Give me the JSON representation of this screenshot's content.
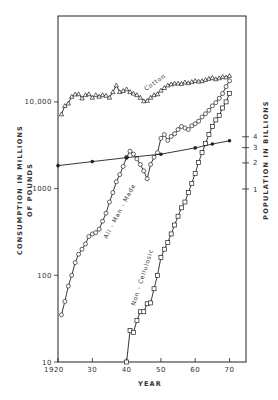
{
  "chart_data": {
    "type": "line",
    "title": "",
    "xlabel": "YEAR",
    "ylabel": "CONSUMPTION IN MILLIONS OF POUNDS",
    "ylabel_line1": "CONSUMPTION  IN  MILLIONS",
    "ylabel_line2": "OF  POUNDS",
    "y2label": "POPULATION  IN  BILLIONS",
    "yscale": "log",
    "xlim": [
      1920,
      1975
    ],
    "ylim": [
      10,
      100000
    ],
    "y2lim_ticks": [
      1,
      2,
      3,
      4
    ],
    "grid": false,
    "legend": "inline labels",
    "x_ticks": [
      {
        "value": 1920,
        "label": "1920"
      },
      {
        "value": 1930,
        "label": "30"
      },
      {
        "value": 1940,
        "label": "40"
      },
      {
        "value": 1950,
        "label": "50"
      },
      {
        "value": 1960,
        "label": "60"
      },
      {
        "value": 1970,
        "label": "70"
      }
    ],
    "y_ticks": [
      {
        "value": 10,
        "label": "10"
      },
      {
        "value": 100,
        "label": "100"
      },
      {
        "value": 1000,
        "label": "1000"
      },
      {
        "value": 10000,
        "label": "10,000"
      }
    ],
    "y2_ticks": [
      {
        "value": 1,
        "label": "1"
      },
      {
        "value": 2,
        "label": "2"
      },
      {
        "value": 3,
        "label": "3"
      },
      {
        "value": 4,
        "label": "4"
      }
    ],
    "series": [
      {
        "name": "Cotton",
        "marker": "triangle",
        "x": [
          1921,
          1922,
          1923,
          1924,
          1925,
          1926,
          1927,
          1928,
          1929,
          1930,
          1931,
          1932,
          1933,
          1934,
          1935,
          1936,
          1937,
          1938,
          1939,
          1940,
          1941,
          1942,
          1943,
          1944,
          1945,
          1946,
          1947,
          1948,
          1949,
          1950,
          1951,
          1952,
          1953,
          1954,
          1955,
          1956,
          1957,
          1958,
          1959,
          1960,
          1961,
          1962,
          1963,
          1964,
          1965,
          1966,
          1967,
          1968,
          1969,
          1970
        ],
        "values": [
          7200,
          9000,
          9600,
          11500,
          12200,
          12300,
          11000,
          12000,
          12300,
          11200,
          12000,
          11500,
          12000,
          11800,
          11200,
          13000,
          15500,
          13000,
          13400,
          14000,
          13000,
          12500,
          12000,
          11200,
          10200,
          10300,
          11200,
          12000,
          12300,
          13500,
          14500,
          15500,
          16000,
          16300,
          16300,
          16200,
          16800,
          16500,
          17000,
          17500,
          17200,
          17400,
          18000,
          18500,
          19000,
          18300,
          18800,
          19500,
          19200,
          20000
        ]
      },
      {
        "name": "All - Man - Made",
        "marker": "circle",
        "x": [
          1921,
          1922,
          1923,
          1924,
          1925,
          1926,
          1927,
          1928,
          1929,
          1930,
          1931,
          1932,
          1933,
          1934,
          1935,
          1936,
          1937,
          1938,
          1939,
          1940,
          1941,
          1942,
          1943,
          1944,
          1945,
          1946,
          1947,
          1948,
          1949,
          1950,
          1951,
          1952,
          1953,
          1954,
          1955,
          1956,
          1957,
          1958,
          1959,
          1960,
          1961,
          1962,
          1963,
          1964,
          1965,
          1966,
          1967,
          1968,
          1969,
          1970
        ],
        "values": [
          35,
          50,
          75,
          100,
          140,
          175,
          200,
          230,
          280,
          300,
          310,
          340,
          420,
          520,
          700,
          900,
          1200,
          1450,
          1800,
          2300,
          2700,
          2500,
          2200,
          1900,
          1600,
          1300,
          1900,
          2300,
          2600,
          3800,
          4200,
          3600,
          4000,
          4300,
          4800,
          5200,
          5000,
          4800,
          5300,
          5600,
          6000,
          6700,
          7300,
          8000,
          9000,
          9800,
          11000,
          12500,
          15000,
          17500
        ]
      },
      {
        "name": "Non - Cellulosic",
        "marker": "square",
        "x": [
          1940,
          1941,
          1942,
          1943,
          1944,
          1945,
          1946,
          1947,
          1948,
          1949,
          1950,
          1951,
          1952,
          1953,
          1954,
          1955,
          1956,
          1957,
          1958,
          1959,
          1960,
          1961,
          1962,
          1963,
          1964,
          1965,
          1966,
          1967,
          1968,
          1969,
          1970
        ],
        "values": [
          10,
          23,
          22,
          30,
          38,
          38,
          47,
          48,
          70,
          100,
          160,
          200,
          240,
          300,
          380,
          480,
          600,
          700,
          900,
          1150,
          1500,
          2000,
          2600,
          3300,
          4200,
          5200,
          6200,
          7000,
          8500,
          10000,
          12500
        ]
      },
      {
        "name": "Population",
        "axis": "right",
        "unit": "billions",
        "marker": "filled-circle",
        "x": [
          1920,
          1930,
          1940,
          1950,
          1960,
          1965,
          1970
        ],
        "values": [
          1.86,
          2.07,
          2.3,
          2.52,
          2.98,
          3.3,
          3.6
        ]
      }
    ],
    "annotations": [
      "Cotton",
      "All - Man - Made",
      "Non - Cellulosic"
    ]
  }
}
